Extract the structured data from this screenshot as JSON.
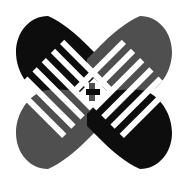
{
  "image": {
    "kind": "logo-mark",
    "title": "Interlaced X Logo",
    "description": "Four-lobed X / butterfly mark with woven finger stripes",
    "width": 187,
    "height": 183,
    "background_color": "#ffffff"
  },
  "palette": {
    "background": "#ffffff",
    "dark": "#0d0d0d",
    "gray": "#4f4f4f",
    "gap": "#ffffff"
  },
  "geometry": {
    "center_x": 93,
    "center_y": 92,
    "bounds": {
      "left": 16,
      "top": 16,
      "right": 172,
      "bottom": 169
    },
    "stripe_count_per_lobe": 5,
    "stripe_width": 7,
    "stripe_gap": 6,
    "weave_block": 7
  },
  "lobes": [
    {
      "id": "top-left",
      "name": "lobe-top-left",
      "color_key": "dark",
      "color": "#0d0d0d",
      "apex_x": 48,
      "apex_y": 16,
      "direction": "down-right"
    },
    {
      "id": "top-right",
      "name": "lobe-top-right",
      "color_key": "gray",
      "color": "#4f4f4f",
      "apex_x": 140,
      "apex_y": 16,
      "direction": "down-left"
    },
    {
      "id": "bottom-left",
      "name": "lobe-bottom-left",
      "color_key": "gray",
      "color": "#4f4f4f",
      "apex_x": 48,
      "apex_y": 169,
      "direction": "up-right"
    },
    {
      "id": "bottom-right",
      "name": "lobe-bottom-right",
      "color_key": "dark",
      "color": "#0d0d0d",
      "apex_x": 140,
      "apex_y": 169,
      "direction": "up-left"
    }
  ]
}
